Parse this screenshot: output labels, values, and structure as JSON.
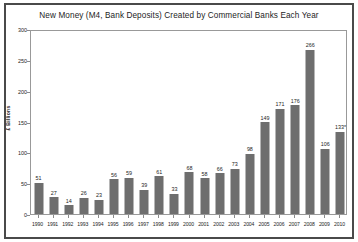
{
  "chart_data": {
    "type": "bar",
    "title": "New Money (M4, Bank Deposits) Created by Commercial Banks Each Year",
    "xlabel": "",
    "ylabel": "£ Billions",
    "ylim": [
      0,
      300
    ],
    "yticks": [
      0,
      50,
      100,
      150,
      200,
      250,
      300
    ],
    "ytick_labels": [
      "0",
      "50",
      "100",
      "150",
      "200",
      "250",
      "300"
    ],
    "grid": false,
    "legend": false,
    "bar_color": "#6e6e6e",
    "categories": [
      "1990",
      "1991",
      "1992",
      "1993",
      "1994",
      "1995",
      "1996",
      "1997",
      "1998",
      "1999",
      "2000",
      "2001",
      "2002",
      "2003",
      "2004",
      "2005",
      "2006",
      "2007",
      "2008",
      "2009",
      "2010"
    ],
    "values": [
      51,
      27,
      14,
      26,
      23,
      56,
      59,
      39,
      61,
      33,
      68,
      58,
      66,
      73,
      98,
      149,
      171,
      176,
      266,
      106,
      133
    ],
    "value_labels": [
      "51",
      "27",
      "14",
      "26",
      "23",
      "56",
      "59",
      "39",
      "61",
      "33",
      "68",
      "58",
      "66",
      "73",
      "98",
      "149",
      "171",
      "176",
      "266",
      "106",
      "133*"
    ]
  }
}
